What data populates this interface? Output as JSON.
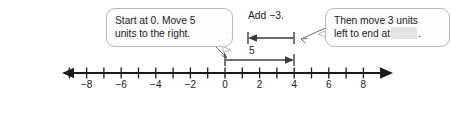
{
  "callouts": {
    "start": {
      "line1": "Start at 0. Move 5",
      "line2": "units to the right."
    },
    "end": {
      "line1": "Then move 3 units",
      "prefix2": "left to end at",
      "suffix2": "."
    }
  },
  "labels": {
    "add": "Add −3.",
    "jump_right": "5"
  },
  "number_line": {
    "tick_labels": [
      "−8",
      "−6",
      "−4",
      "−2",
      "0",
      "2",
      "4",
      "6",
      "8"
    ],
    "tick_values": [
      -8,
      -6,
      -4,
      -2,
      0,
      2,
      4,
      6,
      8
    ],
    "min": -9,
    "max": 9,
    "origin_x": 225,
    "unit_px": 17.3,
    "axis_y": 73
  },
  "arrows": {
    "right_jump": {
      "from": 0,
      "to": 5,
      "label": "5",
      "direction": "right"
    },
    "left_jump": {
      "from": 5,
      "to": 2,
      "label": "Add −3.",
      "direction": "left"
    }
  },
  "conclusion": {
    "prefix": "So, 5 + (−3) =",
    "suffix": "."
  },
  "colors": {
    "ink": "#1b1b1b",
    "line": "#3a3a3a",
    "bubble_border": "#b9b9b9",
    "bubble_fill": "#fdfdfd",
    "blank_fill": "#e2e4e6"
  }
}
